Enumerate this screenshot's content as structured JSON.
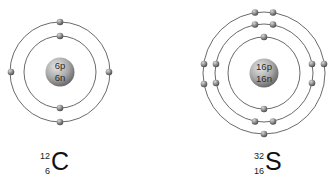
{
  "figure": {
    "atoms": [
      {
        "element": "Carbon",
        "symbol": "C",
        "mass_number": "12",
        "atomic_number": "6",
        "nucleus": {
          "protons_label": "6p",
          "neutrons_label": "6n"
        },
        "shells": [
          {
            "shell": 1,
            "electrons": 2
          },
          {
            "shell": 2,
            "electrons": 4
          }
        ]
      },
      {
        "element": "Sulfur",
        "symbol": "S",
        "mass_number": "32",
        "atomic_number": "16",
        "nucleus": {
          "protons_label": "16p",
          "neutrons_label": "16n"
        },
        "shells": [
          {
            "shell": 1,
            "electrons": 2
          },
          {
            "shell": 2,
            "electrons": 8
          },
          {
            "shell": 3,
            "electrons": 6
          }
        ]
      }
    ]
  },
  "colors": {
    "orbit": "#6a6a6a",
    "electron": "#7a7a7a",
    "nucleus": "#9a9a9a",
    "background": "#ffffff"
  }
}
